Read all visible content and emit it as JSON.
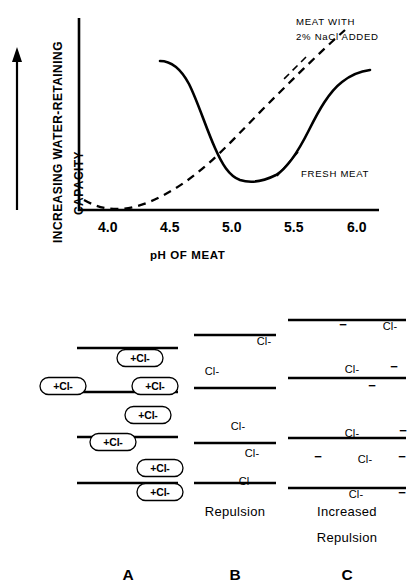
{
  "chart_data": {
    "type": "line",
    "title": "",
    "xlabel": "pH OF MEAT",
    "ylabel": "INCREASING WATER-RETAINING CAPACITY",
    "xlim": [
      3.75,
      6.05
    ],
    "ylim": [
      0,
      1
    ],
    "xticks": [
      "4.0",
      "4.5",
      "5.0",
      "5.5",
      "6.0"
    ],
    "xtick_values": [
      4.0,
      4.5,
      5.0,
      5.5,
      6.0
    ],
    "yticks": [],
    "grid": false,
    "legend_position": "inline-annotations",
    "axis_arrow": "upward arrow beside y-axis label indicating increasing capacity",
    "series": [
      {
        "name": "FRESH MEAT",
        "style": "solid",
        "label": "FRESH MEAT",
        "x": [
          4.42,
          4.5,
          4.6,
          4.7,
          4.8,
          4.9,
          5.0,
          5.1,
          5.2,
          5.3,
          5.4,
          5.5,
          5.6,
          5.7,
          5.8,
          5.9,
          6.0
        ],
        "y": [
          0.8,
          0.78,
          0.72,
          0.62,
          0.5,
          0.38,
          0.27,
          0.21,
          0.2,
          0.22,
          0.27,
          0.38,
          0.53,
          0.65,
          0.71,
          0.74,
          0.75
        ]
      },
      {
        "name": "MEAT WITH 2% NaCl ADDED",
        "style": "dashed",
        "label": "MEAT WITH\n2% NaCl ADDED",
        "x": [
          3.82,
          3.95,
          4.1,
          4.25,
          4.4,
          4.55,
          4.7,
          4.85,
          5.0,
          5.15,
          5.3,
          5.45,
          5.6,
          5.75,
          5.9,
          6.0
        ],
        "y": [
          0.1,
          0.055,
          0.03,
          0.035,
          0.055,
          0.09,
          0.135,
          0.19,
          0.26,
          0.34,
          0.43,
          0.53,
          0.63,
          0.73,
          0.82,
          0.88
        ]
      }
    ],
    "annotations": [
      {
        "text_line1": "MEAT WITH",
        "text_line2": "2% NaCl ADDED",
        "points_to": "dashed curve"
      },
      {
        "text_line1": "FRESH MEAT",
        "points_to": "solid curve"
      }
    ]
  },
  "chart": {
    "ylabel_line1": "INCREASING WATER-RETAINING",
    "ylabel_line2": "CAPACITY",
    "xlabel": "pH OF MEAT",
    "xticks": [
      "4.0",
      "4.5",
      "5.0",
      "5.5",
      "6.0"
    ],
    "annotation_nacl_line1": "MEAT WITH",
    "annotation_nacl_line2": "2% NaCl ADDED",
    "annotation_fresh": "FRESH MEAT"
  },
  "diagram": {
    "panels": [
      {
        "letter": "A",
        "caption": "",
        "ion_label": "+Cl-",
        "ions": [
          {
            "x": 140,
            "y": 73
          },
          {
            "x": 63,
            "y": 101
          },
          {
            "x": 155,
            "y": 101
          },
          {
            "x": 148,
            "y": 130
          },
          {
            "x": 113,
            "y": 157
          },
          {
            "x": 160,
            "y": 183
          },
          {
            "x": 160,
            "y": 207
          }
        ]
      },
      {
        "letter": "B",
        "caption": "Repulsion",
        "cl_label": "Cl-",
        "cl_positions": [
          {
            "x": 264,
            "y": 60
          },
          {
            "x": 212,
            "y": 90
          },
          {
            "x": 238,
            "y": 145
          },
          {
            "x": 252,
            "y": 172
          },
          {
            "x": 246,
            "y": 200
          }
        ]
      },
      {
        "letter": "C",
        "caption_line1": "Increased",
        "caption_line2": "Repulsion",
        "cl_label": "Cl-",
        "minus_label": "−",
        "cl_positions": [
          {
            "x": 390,
            "y": 45
          },
          {
            "x": 352,
            "y": 88
          },
          {
            "x": 352,
            "y": 152
          },
          {
            "x": 365,
            "y": 178
          },
          {
            "x": 356,
            "y": 213
          }
        ],
        "minus_positions": [
          {
            "x": 343,
            "y": 44
          },
          {
            "x": 394,
            "y": 86
          },
          {
            "x": 372,
            "y": 105
          },
          {
            "x": 403,
            "y": 150
          },
          {
            "x": 318,
            "y": 176
          },
          {
            "x": 402,
            "y": 176
          },
          {
            "x": 402,
            "y": 212
          }
        ]
      }
    ]
  }
}
